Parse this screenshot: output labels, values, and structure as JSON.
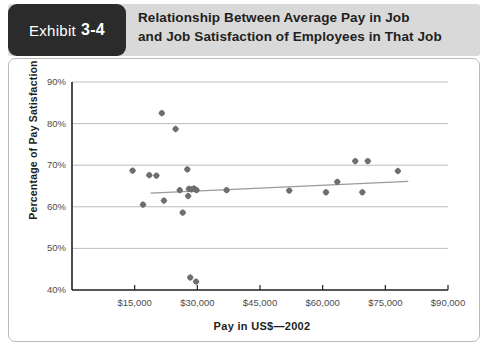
{
  "exhibit": {
    "badge_word": "Exhibit",
    "badge_number": "3-4",
    "title_line1": "Relationship Between Average Pay in Job",
    "title_line2": "and Job Satisfaction of Employees in That Job"
  },
  "colors": {
    "badge_background": "#2b2b2b",
    "badge_text": "#ffffff",
    "header_band": "#d9d9d9",
    "title_text": "#231f20",
    "frame_border": "#b9b9b9",
    "axis": "#231f20",
    "gridline": "#b5b5b5",
    "marker": "#6e6e6e",
    "trendline": "#9a9a9a"
  },
  "chart_data": {
    "type": "scatter",
    "title": "Relationship Between Average Pay in Job and Job Satisfaction of Employees in That Job",
    "xlabel": "Pay in US$—2002",
    "ylabel": "Percentage of Pay Satisfaction",
    "xlim": [
      0,
      90000
    ],
    "ylim": [
      40,
      90
    ],
    "grid": true,
    "legend": "none",
    "xticks": [
      15000,
      30000,
      45000,
      60000,
      75000,
      90000
    ],
    "xticklabels": [
      "$15,000",
      "$30,000",
      "$45,000",
      "$60,000",
      "$75,000",
      "$90,000"
    ],
    "yticks": [
      40,
      50,
      60,
      70,
      80,
      90
    ],
    "yticklabels": [
      "40%",
      "50%",
      "60%",
      "70%",
      "80%",
      "90%"
    ],
    "points": [
      {
        "x": 14500,
        "y": 68.7
      },
      {
        "x": 17000,
        "y": 60.5
      },
      {
        "x": 18500,
        "y": 67.6
      },
      {
        "x": 20200,
        "y": 67.5
      },
      {
        "x": 21500,
        "y": 82.5
      },
      {
        "x": 22000,
        "y": 61.5
      },
      {
        "x": 24800,
        "y": 78.7
      },
      {
        "x": 25800,
        "y": 64.0
      },
      {
        "x": 26500,
        "y": 58.6
      },
      {
        "x": 27600,
        "y": 69.0
      },
      {
        "x": 28000,
        "y": 64.3
      },
      {
        "x": 28600,
        "y": 64.2
      },
      {
        "x": 29200,
        "y": 64.4
      },
      {
        "x": 29800,
        "y": 64.0
      },
      {
        "x": 27800,
        "y": 62.6
      },
      {
        "x": 28300,
        "y": 43.0
      },
      {
        "x": 29700,
        "y": 42.0
      },
      {
        "x": 37000,
        "y": 64.0
      },
      {
        "x": 52000,
        "y": 63.9
      },
      {
        "x": 60800,
        "y": 63.5
      },
      {
        "x": 63500,
        "y": 66.0
      },
      {
        "x": 67800,
        "y": 71.0
      },
      {
        "x": 70800,
        "y": 71.0
      },
      {
        "x": 69500,
        "y": 63.5
      },
      {
        "x": 78000,
        "y": 68.6
      }
    ],
    "trendline": {
      "x_start": 18800,
      "y_start": 63.3,
      "x_end": 80500,
      "y_end": 66.1
    }
  }
}
